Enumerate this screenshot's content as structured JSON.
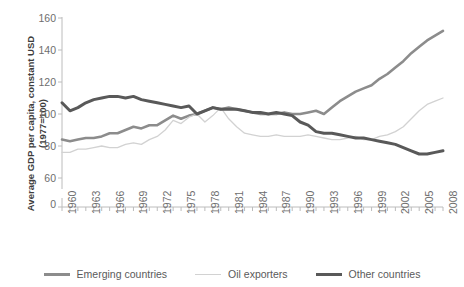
{
  "chart_data": {
    "type": "line",
    "title": "",
    "xlabel": "",
    "ylabel_line1": "Average GDP per capita, constant USD",
    "ylabel_line2": "(1977=100)",
    "ylim": [
      60,
      160
    ],
    "yticks": [
      0,
      60,
      80,
      100,
      120,
      140,
      160
    ],
    "ytick_labels": [
      "0",
      "60",
      "80",
      "100",
      "120",
      "140",
      "160"
    ],
    "axis_break": true,
    "grid": false,
    "legend_position": "bottom",
    "x": [
      1960,
      1961,
      1962,
      1963,
      1964,
      1965,
      1966,
      1967,
      1968,
      1969,
      1970,
      1971,
      1972,
      1973,
      1974,
      1975,
      1976,
      1977,
      1978,
      1979,
      1980,
      1981,
      1982,
      1983,
      1984,
      1985,
      1986,
      1987,
      1988,
      1989,
      1990,
      1991,
      1992,
      1993,
      1994,
      1995,
      1996,
      1997,
      1998,
      1999,
      2000,
      2001,
      2002,
      2003,
      2004,
      2005,
      2006,
      2007,
      2008
    ],
    "xtick_labels": [
      "1960",
      "1963",
      "1966",
      "1969",
      "1972",
      "1975",
      "1978",
      "1981",
      "1984",
      "1987",
      "1990",
      "1993",
      "1996",
      "1999",
      "2002",
      "2005",
      "2008"
    ],
    "xtick_values": [
      1960,
      1963,
      1966,
      1969,
      1972,
      1975,
      1978,
      1981,
      1984,
      1987,
      1990,
      1993,
      1996,
      1999,
      2002,
      2005,
      2008
    ],
    "series": [
      {
        "name": "Emerging countries",
        "color": "#8c8c8c",
        "width": 2.6,
        "values": [
          84,
          83,
          84,
          85,
          85,
          86,
          88,
          88,
          90,
          92,
          91,
          93,
          93,
          96,
          99,
          97,
          99,
          100,
          102,
          104,
          103,
          104,
          103,
          102,
          101,
          100,
          100,
          100,
          101,
          100,
          100,
          101,
          102,
          100,
          104,
          108,
          111,
          114,
          116,
          118,
          122,
          125,
          129,
          133,
          138,
          142,
          146,
          149,
          152
        ]
      },
      {
        "name": "Oil exporters",
        "color": "#d2d2d2",
        "width": 1.3,
        "values": [
          76,
          76,
          78,
          78,
          79,
          80,
          79,
          79,
          81,
          82,
          81,
          84,
          86,
          90,
          96,
          94,
          98,
          100,
          95,
          99,
          104,
          97,
          92,
          88,
          87,
          86,
          86,
          87,
          86,
          86,
          86,
          87,
          86,
          85,
          84,
          84,
          85,
          86,
          84,
          84,
          86,
          87,
          89,
          92,
          97,
          102,
          106,
          108,
          110
        ]
      },
      {
        "name": "Other countries",
        "color": "#595959",
        "width": 3.0,
        "values": [
          107,
          102,
          104,
          107,
          109,
          110,
          111,
          111,
          110,
          111,
          109,
          108,
          107,
          106,
          105,
          104,
          105,
          100,
          102,
          104,
          103,
          103,
          103,
          102,
          101,
          101,
          100,
          101,
          100,
          99,
          95,
          93,
          89,
          88,
          88,
          87,
          86,
          85,
          85,
          84,
          83,
          82,
          81,
          79,
          77,
          75,
          75,
          76,
          77
        ]
      }
    ],
    "legend": [
      {
        "label": "Emerging countries",
        "color": "#8c8c8c",
        "width": 3.0
      },
      {
        "label": "Oil exporters",
        "color": "#d2d2d2",
        "width": 1.4
      },
      {
        "label": "Other countries",
        "color": "#595959",
        "width": 3.4
      }
    ]
  }
}
